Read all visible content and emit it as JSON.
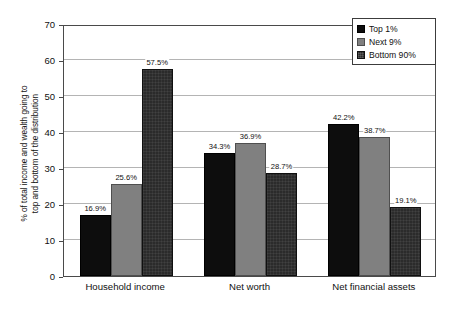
{
  "chart_data": {
    "type": "bar",
    "title": "",
    "subtitle": "",
    "xlabel": "",
    "ylabel": "% of total income and wealth going to top and bottom of the distribution",
    "ylabel_lines": [
      "% of total income and wealth going to",
      "top and bottom of the distribution"
    ],
    "categories": [
      "Household income",
      "Net worth",
      "Net financial assets"
    ],
    "series": [
      {
        "name": "Top 1%",
        "color": "#0d0d0d",
        "values": [
          16.9,
          25.6,
          42.2
        ]
      },
      {
        "name": "Next 9%",
        "color": "#808080",
        "values": [
          25.6,
          36.9,
          38.7
        ]
      },
      {
        "name": "Bottom 90%",
        "color": "#2b2b2b",
        "values": [
          57.5,
          28.7,
          19.1
        ]
      }
    ],
    "series_by_category": [
      {
        "category": "Household income",
        "bars": [
          {
            "series": "Top 1%",
            "value": 16.9,
            "label": "16.9%",
            "color": "#0d0d0d"
          },
          {
            "series": "Next 9%",
            "value": 25.6,
            "label": "25.6%",
            "color": "#808080"
          },
          {
            "series": "Bottom 90%",
            "value": 57.5,
            "label": "57.5%",
            "color": "#2b2b2b"
          }
        ]
      },
      {
        "category": "Net worth",
        "bars": [
          {
            "series": "Top 1%",
            "value": 34.3,
            "label": "34.3%",
            "color": "#0d0d0d"
          },
          {
            "series": "Next 9%",
            "value": 36.9,
            "label": "36.9%",
            "color": "#808080"
          },
          {
            "series": "Bottom 90%",
            "value": 28.7,
            "label": "28.7%",
            "color": "#2b2b2b"
          }
        ]
      },
      {
        "category": "Net financial assets",
        "bars": [
          {
            "series": "Top 1%",
            "value": 42.2,
            "label": "42.2%",
            "color": "#0d0d0d"
          },
          {
            "series": "Next 9%",
            "value": 38.7,
            "label": "38.7%",
            "color": "#808080"
          },
          {
            "series": "Bottom 90%",
            "value": 19.1,
            "label": "19.1%",
            "color": "#2b2b2b"
          }
        ]
      }
    ],
    "ylim": [
      0,
      70
    ],
    "ytick_step": 10,
    "yticks": [
      0,
      10,
      20,
      30,
      40,
      50,
      60,
      70
    ],
    "ytick_labels": [
      "0",
      "10",
      "20",
      "30",
      "40",
      "50",
      "60",
      "70"
    ],
    "grid": true,
    "grid_axis": "y",
    "grid_color": "#b4b4b4",
    "axis_color": "#4a4a4a",
    "background_color": "#ffffff",
    "legend": {
      "position": "top-right",
      "border_color": "#3c3c3c",
      "entries": [
        {
          "label": "Top 1%",
          "color": "#0d0d0d",
          "pattern": "solid"
        },
        {
          "label": "Next 9%",
          "color": "#808080",
          "pattern": "solid"
        },
        {
          "label": "Bottom 90%",
          "color": "#2b2b2b",
          "pattern": "textured"
        }
      ]
    }
  }
}
